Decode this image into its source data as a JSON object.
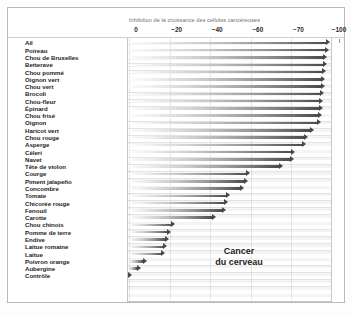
{
  "chart_data": {
    "type": "bar",
    "orientation": "horizontal",
    "title": "Inhibition de la croissance des cellules cancéreuses",
    "xlabel": "",
    "ylabel": "",
    "annotation": {
      "line1": "Cancer",
      "line2": "du cerveau"
    },
    "axis": {
      "tick_labels": [
        "0",
        "−20",
        "−40",
        "−60",
        "−70",
        "−100"
      ],
      "tick_values": [
        0,
        -20,
        -40,
        -60,
        -70,
        -100
      ],
      "minor_ticks": true,
      "grid": true,
      "xlim": [
        0,
        -100
      ]
    },
    "categories": [
      "Ail",
      "Poireau",
      "Chou de Bruxelles",
      "Betterave",
      "Chou pommé",
      "Oignon vert",
      "Chou vert",
      "Brocoli",
      "Chou-fleur",
      "Épinard",
      "Chou frisé",
      "Oignon",
      "Haricot vert",
      "Chou rouge",
      "Asperge",
      "Céleri",
      "Navet",
      "Tête de violon",
      "Courge",
      "Piment jalapeño",
      "Concombre",
      "Tomate",
      "Chicorée rouge",
      "Fenouil",
      "Carotte",
      "Chou chinois",
      "Pomme de terre",
      "Endive",
      "Laitue romaine",
      "Laitue",
      "Poivron orange",
      "Aubergine",
      "Contrôle"
    ],
    "values": [
      -99,
      -98,
      -97,
      -96.5,
      -96,
      -95.5,
      -95,
      -94.5,
      -94,
      -93.5,
      -93,
      -92,
      -87,
      -83,
      -81,
      -73,
      -72,
      -68,
      -60,
      -59,
      -57,
      -50,
      -49,
      -48,
      -43,
      -23,
      -21,
      -20,
      -19,
      -18,
      -9,
      -6,
      -0.7
    ]
  },
  "labels": {
    "items": [
      "Ail",
      "Poireau",
      "Chou de Bruxelles",
      "Betterave",
      "Chou pommé",
      "Oignon vert",
      "Chou vert",
      "Brocoli",
      "Chou-fleur",
      "Épinard",
      "Chou frisé",
      "Oignon",
      "Haricot vert",
      "Chou rouge",
      "Asperge",
      "Céleri",
      "Navet",
      "Tête de violon",
      "Courge",
      "Piment jalapeño",
      "Concombre",
      "Tomate",
      "Chicorée rouge",
      "Fenouil",
      "Carotte",
      "Chou chinois",
      "Pomme de terre",
      "Endive",
      "Laitue romaine",
      "Laitue",
      "Poivron orange",
      "Aubergine",
      "Contrôle"
    ]
  },
  "style": {
    "bar_dark": "#474747",
    "bar_light": "#fcfcfc",
    "frame": "#b9b9b9",
    "text": "#1c1c1c",
    "title_text": "#6f6f6f"
  }
}
